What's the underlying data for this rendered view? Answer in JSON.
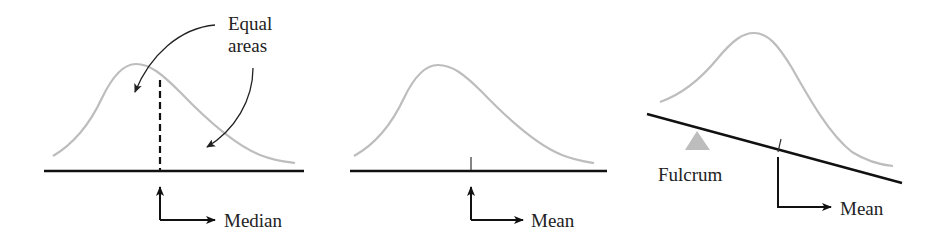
{
  "colors": {
    "curve": "#bdbdbd",
    "axis": "#111111",
    "fulcrum": "#bdbdbd",
    "text": "#222222"
  },
  "panels": [
    {
      "id": "median",
      "annotation_lines": [
        "Equal",
        "areas"
      ],
      "marker_label": "Median",
      "marker_style": "dashed-line"
    },
    {
      "id": "mean",
      "marker_label": "Mean",
      "marker_style": "tick"
    },
    {
      "id": "fulcrum",
      "fulcrum_label": "Fulcrum",
      "marker_label": "Mean",
      "marker_style": "tick"
    }
  ]
}
